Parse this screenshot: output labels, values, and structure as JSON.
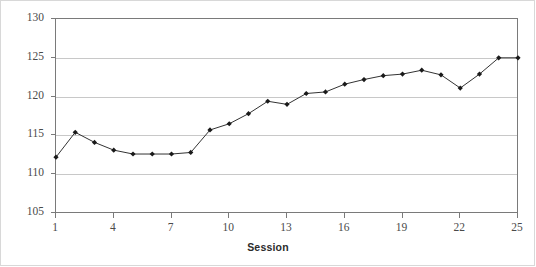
{
  "chart_data": {
    "type": "line",
    "title": "",
    "subtitle": "",
    "xlabel": "Session",
    "ylabel": "",
    "x": [
      1,
      2,
      3,
      4,
      5,
      6,
      7,
      8,
      9,
      10,
      11,
      12,
      13,
      14,
      15,
      16,
      17,
      18,
      19,
      20,
      21,
      22,
      23,
      24,
      25
    ],
    "values": [
      112.2,
      115.4,
      114.1,
      113.1,
      112.6,
      112.6,
      112.6,
      112.8,
      115.7,
      116.5,
      117.8,
      119.4,
      119.0,
      120.4,
      120.6,
      121.6,
      122.2,
      122.7,
      122.9,
      123.4,
      122.8,
      121.1,
      122.9,
      125.0,
      125.0
    ],
    "series": [
      {
        "name": "",
        "values": [
          112.2,
          115.4,
          114.1,
          113.1,
          112.6,
          112.6,
          112.6,
          112.8,
          115.7,
          116.5,
          117.8,
          119.4,
          119.0,
          120.4,
          120.6,
          121.6,
          122.2,
          122.7,
          122.9,
          123.4,
          122.8,
          121.1,
          122.9,
          125.0,
          125.0
        ]
      }
    ],
    "ylim": [
      105,
      130
    ],
    "xlim": [
      1,
      25
    ],
    "yticks": [
      105,
      110,
      115,
      120,
      125,
      130
    ],
    "ytick_labels": [
      "105",
      "110",
      "115",
      "120",
      "125",
      "130"
    ],
    "xticks": [
      1,
      4,
      7,
      10,
      13,
      16,
      19,
      22,
      25
    ],
    "xtick_labels": [
      "1",
      "4",
      "7",
      "10",
      "13",
      "16",
      "19",
      "22",
      "25"
    ],
    "grid": "horizontal",
    "legend": "none",
    "marker": "diamond",
    "line_color": "#333333",
    "marker_color": "#1a1a1a",
    "grid_color": "#c8c8c8",
    "axis_color": "#7a7a7a",
    "background": "#ffffff"
  }
}
